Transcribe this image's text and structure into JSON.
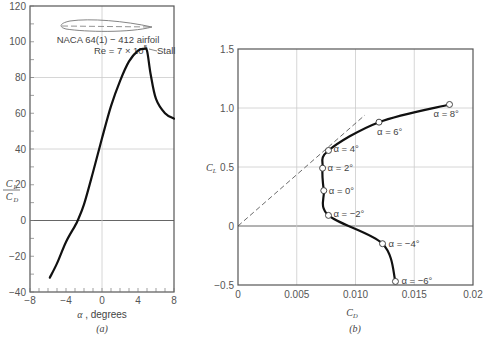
{
  "chart_data": [
    {
      "id": "a",
      "type": "line",
      "panel_label": "(a)",
      "title": "",
      "xlabel": "α , degrees",
      "ylabel_num": "C_L",
      "ylabel_den": "C_D",
      "xlim": [
        -8,
        8
      ],
      "ylim": [
        -40,
        120
      ],
      "xticks": [
        -8,
        -4,
        0,
        4,
        8
      ],
      "yticks": [
        -40,
        -20,
        0,
        20,
        40,
        60,
        80,
        100,
        120
      ],
      "grid_y": [
        0,
        40,
        80
      ],
      "grid_x": [
        0
      ],
      "annotations": {
        "airfoil_name": "NACA 64(1) − 412 airfoil",
        "reynolds": "Re = 7 × 10",
        "reynolds_exp": "5",
        "stall": "Stall"
      },
      "series": [
        {
          "name": "CL/CD",
          "x": [
            -5.8,
            -5.0,
            -4.0,
            -3.0,
            -2.7,
            -2.0,
            -1.0,
            0.0,
            1.0,
            2.0,
            3.0,
            4.0,
            4.6,
            5.0,
            5.4,
            6.0,
            7.0,
            8.0
          ],
          "y": [
            -32,
            -24,
            -12,
            -3,
            0,
            9,
            27,
            46,
            64,
            78,
            89,
            95,
            96,
            95,
            82,
            68,
            60,
            57
          ]
        }
      ]
    },
    {
      "id": "b",
      "type": "line",
      "panel_label": "(b)",
      "title": "",
      "xlabel": "C_D",
      "ylabel": "C_L",
      "xlim": [
        0,
        0.02
      ],
      "ylim": [
        -0.5,
        1.5
      ],
      "xticks": [
        0,
        0.005,
        0.01,
        0.015,
        0.02
      ],
      "xtick_labels": [
        "0",
        "0.005",
        "0.010",
        "0.015",
        "0.02"
      ],
      "yticks": [
        -0.5,
        0,
        0.5,
        1.0,
        1.5
      ],
      "ytick_labels": [
        "−0.5",
        "0",
        "0.5",
        "1.0",
        "1.5"
      ],
      "grid_y": [
        0,
        0.5,
        1.0
      ],
      "grid_x": [
        0.005,
        0.01,
        0.015
      ],
      "series": [
        {
          "name": "Drag polar",
          "points": [
            {
              "alpha": -6,
              "label": "α = −6°",
              "cd": 0.0134,
              "cl": -0.47
            },
            {
              "alpha": -4,
              "label": "α = −4°",
              "cd": 0.0123,
              "cl": -0.15
            },
            {
              "alpha": -2,
              "label": "α = −2°",
              "cd": 0.0077,
              "cl": 0.09
            },
            {
              "alpha": 0,
              "label": "α = 0°",
              "cd": 0.0073,
              "cl": 0.3
            },
            {
              "alpha": 2,
              "label": "α = 2°",
              "cd": 0.0072,
              "cl": 0.49
            },
            {
              "alpha": 4,
              "label": "α = 4°",
              "cd": 0.0077,
              "cl": 0.64
            },
            {
              "alpha": 6,
              "label": "α = 6°",
              "cd": 0.012,
              "cl": 0.88
            },
            {
              "alpha": 8,
              "label": "α = 8°",
              "cd": 0.018,
              "cl": 1.03
            }
          ]
        },
        {
          "name": "Tangent line (max L/D)",
          "style": "dashed",
          "cd": [
            0,
            0.0108
          ],
          "cl": [
            0,
            0.94
          ]
        }
      ]
    }
  ]
}
